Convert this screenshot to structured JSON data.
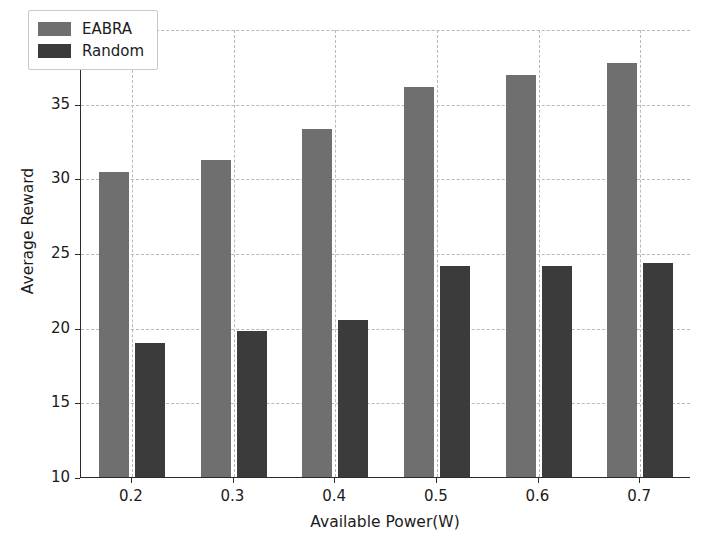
{
  "chart_data": {
    "type": "bar",
    "title": "",
    "xlabel": "Available Power(W)",
    "ylabel": "Average Reward",
    "categories": [
      "0.2",
      "0.3",
      "0.4",
      "0.5",
      "0.6",
      "0.7"
    ],
    "series": [
      {
        "name": "EABRA",
        "color": "#6f6f6f",
        "values": [
          30.4,
          31.2,
          33.3,
          36.1,
          36.9,
          37.7
        ]
      },
      {
        "name": "Random",
        "color": "#3b3b3b",
        "values": [
          19.0,
          19.8,
          20.5,
          24.1,
          24.1,
          24.3
        ]
      }
    ],
    "ylim": [
      10,
      40
    ],
    "yticks": [
      10,
      15,
      20,
      25,
      30,
      35,
      40
    ],
    "ytick_labels": [
      "10",
      "15",
      "20",
      "25",
      "30",
      "35",
      "40"
    ],
    "grid": true,
    "grid_style": "dashed",
    "grid_color": "#b9b9b9",
    "legend_position": "upper left",
    "background": "#ffffff",
    "axis_color": "#2b2b2b"
  }
}
